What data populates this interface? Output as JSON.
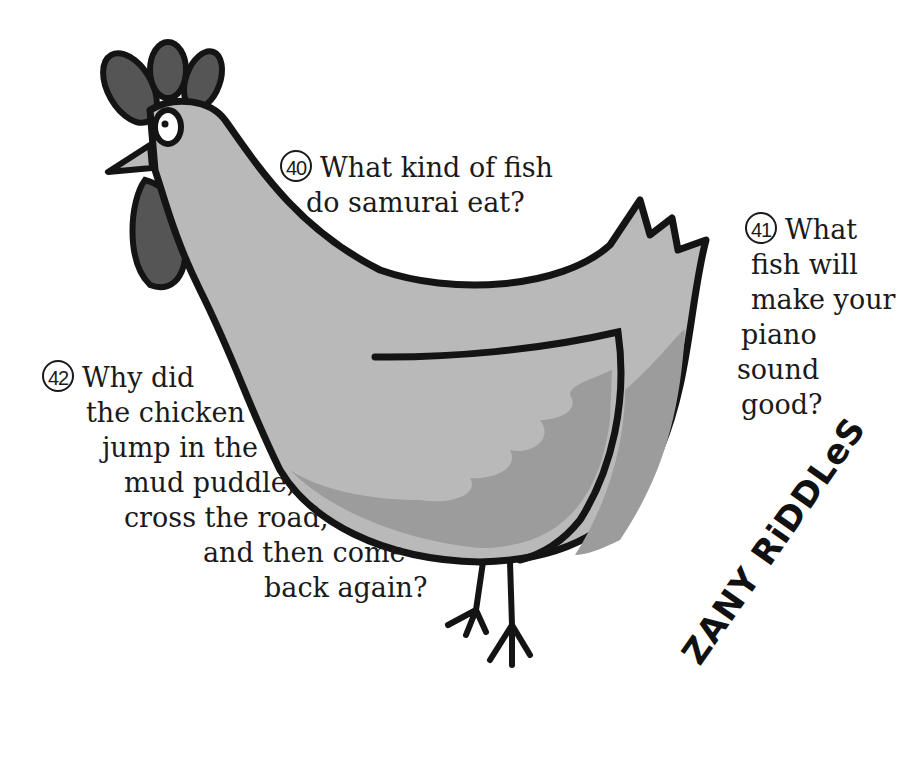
{
  "riddles": [
    {
      "number": "40",
      "lines": [
        "What kind of fish",
        "do samurai eat?"
      ]
    },
    {
      "number": "41",
      "lines": [
        "What",
        "fish will",
        "make your",
        "piano",
        "sound",
        "good?"
      ]
    },
    {
      "number": "42",
      "lines": [
        "Why did",
        "the chicken",
        "jump in the",
        "mud puddle,",
        "cross the road,",
        "and then come",
        "back again?"
      ]
    }
  ],
  "brand": {
    "title": "ZANY RiDDLeS"
  },
  "illustration": {
    "subject": "rooster",
    "colors": {
      "body": "#b9b9b9",
      "wing_shade": "#9c9c9c",
      "comb": "#555555",
      "outline": "#141414",
      "eye": "#ffffff"
    }
  }
}
